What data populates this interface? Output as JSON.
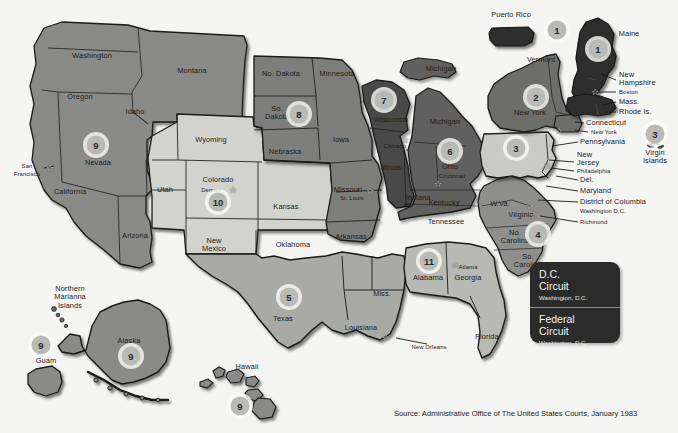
{
  "meta": {
    "source_note": "Source: Administrative Office of The United States Courts, January 1983"
  },
  "legend": {
    "dc": {
      "name_line1": "D.C.",
      "name_line2": "Circuit",
      "city": "Washington, D.C."
    },
    "federal": {
      "name_line1": "Federal",
      "name_line2": "Circuit",
      "city": "Washington, D.C."
    }
  },
  "colors": {
    "background": "#f4f4f2",
    "circuit_1": "#2f2f2f",
    "circuit_2": "#6d6d6b",
    "circuit_3": "#c9c9c6",
    "circuit_4": "#8f8f8d",
    "circuit_5": "#a9a9a6",
    "circuit_6": "#606060",
    "circuit_7": "#4a4a4a",
    "circuit_8": "#7d7d7b",
    "circuit_9": "#8a8a88",
    "circuit_10": "#d2d2cf",
    "circuit_11": "#b8b8b5",
    "outline": "#1a1a1a",
    "legend_bg": "#2b2b2b",
    "badge_bg": "#b9b9b7",
    "text": "#1c1c1c"
  },
  "badges": [
    {
      "id": "badge-puerto-rico",
      "label": "1",
      "x": 557,
      "y": 30
    },
    {
      "id": "badge-maine",
      "label": "1",
      "x": 598,
      "y": 49
    },
    {
      "id": "badge-new-york",
      "label": "2",
      "x": 536,
      "y": 97
    },
    {
      "id": "badge-pennsylvania",
      "label": "3",
      "x": 516,
      "y": 148
    },
    {
      "id": "badge-virgin-islands",
      "label": "3",
      "x": 655,
      "y": 134
    },
    {
      "id": "badge-fourth-circuit",
      "label": "4",
      "x": 538,
      "y": 234
    },
    {
      "id": "badge-texas",
      "label": "5",
      "x": 289,
      "y": 297
    },
    {
      "id": "badge-ohio",
      "label": "6",
      "x": 450,
      "y": 151
    },
    {
      "id": "badge-wisconsin",
      "label": "7",
      "x": 384,
      "y": 100
    },
    {
      "id": "badge-south-dakota",
      "label": "8",
      "x": 299,
      "y": 114
    },
    {
      "id": "badge-nevada",
      "label": "9",
      "x": 96,
      "y": 145
    },
    {
      "id": "badge-guam",
      "label": "9",
      "x": 41,
      "y": 345
    },
    {
      "id": "badge-alaska",
      "label": "9",
      "x": 131,
      "y": 356
    },
    {
      "id": "badge-hawaii",
      "label": "9",
      "x": 240,
      "y": 406
    },
    {
      "id": "badge-colorado",
      "label": "10",
      "x": 218,
      "y": 202
    },
    {
      "id": "badge-alabama",
      "label": "11",
      "x": 429,
      "y": 261
    }
  ],
  "state_labels": [
    {
      "id": "label-washington",
      "text": "Washington",
      "x": 92,
      "y": 56,
      "size": "n"
    },
    {
      "id": "label-montana",
      "text": "Montana",
      "x": 192,
      "y": 71,
      "size": "n"
    },
    {
      "id": "label-oregon",
      "text": "Oregon",
      "x": 80,
      "y": 97,
      "size": "n"
    },
    {
      "id": "label-idaho",
      "text": "Idaho",
      "x": 135,
      "y": 112,
      "size": "n"
    },
    {
      "id": "label-nevada",
      "text": "Nevada",
      "x": 98,
      "y": 163,
      "size": "n"
    },
    {
      "id": "label-california",
      "text": "California",
      "x": 70,
      "y": 192,
      "size": "n"
    },
    {
      "id": "label-arizona",
      "text": "Arizona",
      "x": 135,
      "y": 236,
      "size": "n"
    },
    {
      "id": "label-utah",
      "text": "Utah",
      "x": 165,
      "y": 190,
      "size": "n"
    },
    {
      "id": "label-wyoming",
      "text": "Wyoming",
      "x": 211,
      "y": 140,
      "size": "n"
    },
    {
      "id": "label-colorado",
      "text": "Colorado",
      "x": 218,
      "y": 180,
      "size": "n"
    },
    {
      "id": "label-new-mexico",
      "text": "New\nMexico",
      "x": 214,
      "y": 245,
      "size": "n"
    },
    {
      "id": "label-north-dakota",
      "text": "No. Dakota",
      "x": 281,
      "y": 74,
      "size": "n"
    },
    {
      "id": "label-south-dakota",
      "text": "So.\nDakota",
      "x": 277,
      "y": 113,
      "size": "n"
    },
    {
      "id": "label-nebraska",
      "text": "Nebraska",
      "x": 285,
      "y": 152,
      "size": "n"
    },
    {
      "id": "label-kansas",
      "text": "Kansas",
      "x": 286,
      "y": 207,
      "size": "n"
    },
    {
      "id": "label-oklahoma",
      "text": "Oklahoma",
      "x": 293,
      "y": 245,
      "size": "n"
    },
    {
      "id": "label-texas",
      "text": "Texas",
      "x": 283,
      "y": 319,
      "size": "n"
    },
    {
      "id": "label-minnesota",
      "text": "Minnesota",
      "x": 337,
      "y": 74,
      "size": "n"
    },
    {
      "id": "label-iowa",
      "text": "Iowa",
      "x": 341,
      "y": 140,
      "size": "n"
    },
    {
      "id": "label-missouri",
      "text": "Missouri",
      "x": 348,
      "y": 190,
      "size": "n"
    },
    {
      "id": "label-arkansas",
      "text": "Arkansas",
      "x": 351,
      "y": 237,
      "size": "n"
    },
    {
      "id": "label-louisiana",
      "text": "Louisiana",
      "x": 361,
      "y": 328,
      "size": "n"
    },
    {
      "id": "label-mississippi",
      "text": "Miss.",
      "x": 382,
      "y": 294,
      "size": "n"
    },
    {
      "id": "label-wisconsin",
      "text": "Wisconsin",
      "x": 391,
      "y": 120,
      "size": "n"
    },
    {
      "id": "label-illinois",
      "text": "Illinois",
      "x": 391,
      "y": 168,
      "size": "n"
    },
    {
      "id": "label-indiana",
      "text": "Indiana",
      "x": 418,
      "y": 198,
      "size": "n"
    },
    {
      "id": "label-michigan-lower",
      "text": "Michigan",
      "x": 445,
      "y": 122,
      "size": "n"
    },
    {
      "id": "label-michigan-upper",
      "text": "Michigan",
      "x": 441,
      "y": 69,
      "size": "n"
    },
    {
      "id": "label-ohio",
      "text": "Ohio",
      "x": 450,
      "y": 167,
      "size": "n"
    },
    {
      "id": "label-kentucky",
      "text": "Kentucky",
      "x": 444,
      "y": 203,
      "size": "n"
    },
    {
      "id": "label-tennessee",
      "text": "Tennessee",
      "x": 446,
      "y": 222,
      "size": "n"
    },
    {
      "id": "label-alabama",
      "text": "Alabama",
      "x": 428,
      "y": 278,
      "size": "n"
    },
    {
      "id": "label-georgia",
      "text": "Georgia",
      "x": 468,
      "y": 278,
      "size": "n"
    },
    {
      "id": "label-florida",
      "text": "Florida",
      "x": 487,
      "y": 337,
      "size": "n"
    },
    {
      "id": "label-west-virginia",
      "text": "W.Va.",
      "x": 500,
      "y": 204,
      "size": "n"
    },
    {
      "id": "label-virginia",
      "text": "Virginia",
      "x": 521,
      "y": 215,
      "size": "n"
    },
    {
      "id": "label-north-carolina",
      "text": "No.\nCarolina",
      "x": 515,
      "y": 237,
      "size": "n"
    },
    {
      "id": "label-south-carolina",
      "text": "So.\nCarolina",
      "x": 528,
      "y": 261,
      "size": "n"
    },
    {
      "id": "label-vermont",
      "text": "Vermont",
      "x": 541,
      "y": 60,
      "size": "n"
    },
    {
      "id": "label-new-york",
      "text": "New York",
      "x": 530,
      "y": 113,
      "size": "n"
    },
    {
      "id": "label-maine",
      "text": "Maine",
      "x": 629,
      "y": 34,
      "size": "n"
    },
    {
      "id": "label-puerto-rico",
      "text": "Puerto Rico",
      "x": 511,
      "y": 15,
      "size": "n"
    },
    {
      "id": "label-alaska",
      "text": "Alaska",
      "x": 129,
      "y": 341,
      "size": "n"
    },
    {
      "id": "label-hawaii",
      "text": "Hawaii",
      "x": 247,
      "y": 367,
      "size": "n"
    },
    {
      "id": "label-guam",
      "text": "Guam",
      "x": 46,
      "y": 361,
      "size": "n"
    },
    {
      "id": "label-northern-marianas",
      "text": "Northern\nMarianna\nIslands",
      "x": 70,
      "y": 298,
      "size": "n"
    },
    {
      "id": "label-virgin-islands",
      "text": "Virgin\nIslands",
      "x": 655,
      "y": 157,
      "size": "n"
    }
  ],
  "callout_labels": [
    {
      "id": "label-new-hampshire",
      "text": "New\nHampshire",
      "x": 619,
      "y": 79,
      "align": "left"
    },
    {
      "id": "label-mass",
      "text": "Mass.",
      "x": 619,
      "y": 102,
      "align": "left"
    },
    {
      "id": "label-rhode-island",
      "text": "Rhode Is.",
      "x": 619,
      "y": 112,
      "align": "left"
    },
    {
      "id": "label-connecticut",
      "text": "Connecticut",
      "x": 586,
      "y": 123,
      "align": "left"
    },
    {
      "id": "label-pennsylvania",
      "text": "Pennsylvania",
      "x": 580,
      "y": 142,
      "align": "left"
    },
    {
      "id": "label-new-jersey",
      "text": "New\nJersey",
      "x": 577,
      "y": 159,
      "align": "left"
    },
    {
      "id": "label-delaware",
      "text": "Del.",
      "x": 580,
      "y": 180,
      "align": "left"
    },
    {
      "id": "label-maryland",
      "text": "Maryland",
      "x": 580,
      "y": 191,
      "align": "left"
    },
    {
      "id": "label-district-of-columbia",
      "text": "District of Columbia",
      "x": 580,
      "y": 202,
      "align": "left"
    }
  ],
  "city_labels": [
    {
      "id": "city-san-francisco",
      "text": "San\nFrancisco",
      "x": 27,
      "y": 170,
      "align": "center"
    },
    {
      "id": "city-denver",
      "text": "Denver",
      "x": 211,
      "y": 190,
      "align": "center"
    },
    {
      "id": "city-st-louis",
      "text": "St. Louis",
      "x": 352,
      "y": 198,
      "align": "center"
    },
    {
      "id": "city-chicago",
      "text": "Chicago",
      "x": 395,
      "y": 146,
      "align": "center"
    },
    {
      "id": "city-cincinnati",
      "text": "Cincinnati",
      "x": 452,
      "y": 176,
      "align": "center"
    },
    {
      "id": "city-new-orleans",
      "text": "New Orleans",
      "x": 429,
      "y": 347,
      "align": "center"
    },
    {
      "id": "city-atlanta",
      "text": "Atlanta",
      "x": 468,
      "y": 267,
      "align": "center"
    },
    {
      "id": "city-boston",
      "text": "Boston",
      "x": 619,
      "y": 92,
      "align": "left"
    },
    {
      "id": "city-new-york-sm",
      "text": "New York",
      "x": 591,
      "y": 132,
      "align": "left"
    },
    {
      "id": "city-philadelphia",
      "text": "Philadelphia",
      "x": 577,
      "y": 171,
      "align": "left"
    },
    {
      "id": "city-washington-dc",
      "text": "Washington D.C.",
      "x": 580,
      "y": 211,
      "align": "left"
    },
    {
      "id": "city-richmond",
      "text": "Richmond",
      "x": 580,
      "y": 222,
      "align": "left"
    }
  ],
  "stars": [
    {
      "id": "star-san-francisco",
      "x": 50,
      "y": 168
    },
    {
      "id": "star-denver",
      "x": 233,
      "y": 190
    },
    {
      "id": "star-st-louis",
      "x": 370,
      "y": 191
    },
    {
      "id": "star-chicago",
      "x": 405,
      "y": 140
    },
    {
      "id": "star-cincinnati",
      "x": 438,
      "y": 184
    },
    {
      "id": "star-new-orleans",
      "x": 386,
      "y": 338
    },
    {
      "id": "star-atlanta",
      "x": 455,
      "y": 265
    },
    {
      "id": "star-boston",
      "x": 595,
      "y": 92
    },
    {
      "id": "star-new-york",
      "x": 559,
      "y": 131
    },
    {
      "id": "star-philadelphia",
      "x": 548,
      "y": 166
    },
    {
      "id": "star-washington",
      "x": 530,
      "y": 206
    },
    {
      "id": "star-richmond",
      "x": 534,
      "y": 215
    }
  ]
}
